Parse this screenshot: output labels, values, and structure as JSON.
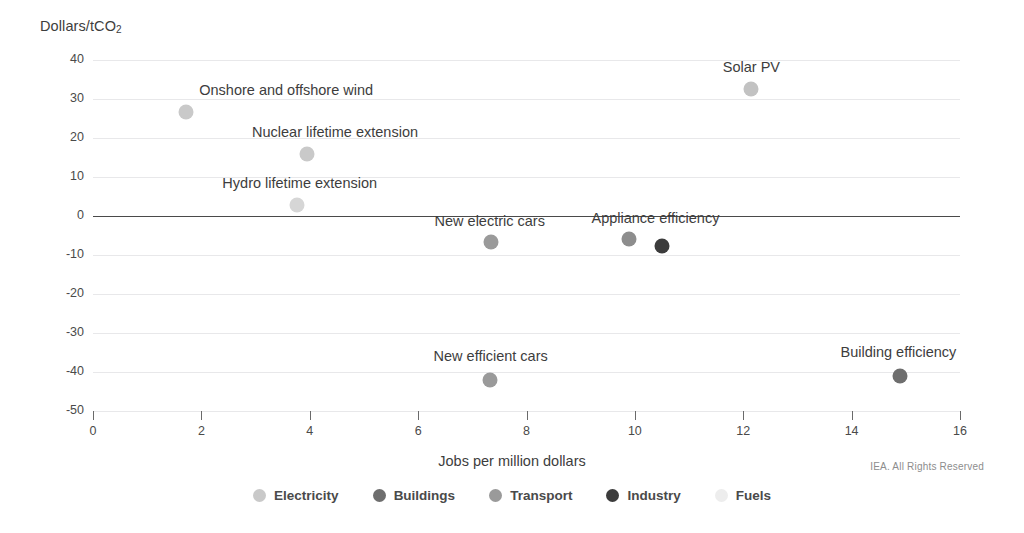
{
  "chart_data": {
    "type": "scatter",
    "title": "",
    "ylabel": "Dollars/tCO₂",
    "ylabel_main": "Dollars/tCO",
    "ylabel_sub": "2",
    "xlabel": "Jobs per million dollars",
    "xlim": [
      0,
      16
    ],
    "ylim": [
      -50,
      40
    ],
    "xticks": [
      0,
      2,
      4,
      6,
      8,
      10,
      12,
      14,
      16
    ],
    "yticks": [
      40,
      30,
      20,
      10,
      0,
      -10,
      -20,
      -30,
      -40,
      -50
    ],
    "grid": "horizontal",
    "legend_position": "bottom-center",
    "series": [
      {
        "name": "Electricity",
        "color": "#c9c9c9"
      },
      {
        "name": "Buildings",
        "color": "#6e6e6e"
      },
      {
        "name": "Transport",
        "color": "#9a9a9a"
      },
      {
        "name": "Industry",
        "color": "#3c3c3c"
      },
      {
        "name": "Fuels",
        "color": "#ededed"
      }
    ],
    "points": [
      {
        "label": "Onshore and offshore wind",
        "x": 1.72,
        "y": 26.7,
        "category": "Electricity",
        "color": "#c9c9c9",
        "label_dx": 100,
        "label_dy": -30
      },
      {
        "label": "Nuclear lifetime extension",
        "x": 3.95,
        "y": 16.0,
        "category": "Electricity",
        "color": "#c9c9c9",
        "label_dx": 28,
        "label_dy": -30
      },
      {
        "label": "Hydro lifetime extension",
        "x": 3.76,
        "y": 2.8,
        "category": "Electricity",
        "color": "#d6d6d6",
        "label_dx": 3,
        "label_dy": -30
      },
      {
        "label": "Solar PV",
        "x": 12.15,
        "y": 32.6,
        "category": "Electricity",
        "color": "#c2c2c2",
        "label_dx": 0,
        "label_dy": -30
      },
      {
        "label": "New electric cars",
        "x": 7.34,
        "y": -6.7,
        "category": "Transport",
        "color": "#9a9a9a",
        "label_dx": -1,
        "label_dy": -29
      },
      {
        "label": "Appliance efficiency",
        "x": 9.9,
        "y": -5.9,
        "category": "Buildings",
        "color": "#8d8d8d",
        "label_dx": 26,
        "label_dy": -29
      },
      {
        "label": "",
        "x": 10.5,
        "y": -7.7,
        "category": "Industry",
        "color": "#3c3c3c",
        "label_dx": 0,
        "label_dy": 0
      },
      {
        "label": "New efficient cars",
        "x": 7.32,
        "y": -42.0,
        "category": "Transport",
        "color": "#9a9a9a",
        "label_dx": 1,
        "label_dy": -32
      },
      {
        "label": "Building efficiency",
        "x": 14.9,
        "y": -41.0,
        "category": "Buildings",
        "color": "#6e6e6e",
        "label_dx": -2,
        "label_dy": -32
      }
    ]
  },
  "footer": {
    "copyright": "IEA. All Rights Reserved"
  }
}
